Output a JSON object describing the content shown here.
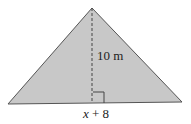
{
  "figure": {
    "shape": "triangle",
    "fill_color": "#c8c8c8",
    "stroke_color": "#555555",
    "height_label": "10 m",
    "base_label_var": "x",
    "base_label_rest": " + 8",
    "right_angle_marker": true
  }
}
